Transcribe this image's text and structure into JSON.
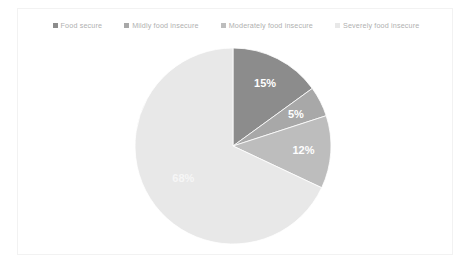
{
  "chart_data": {
    "type": "pie",
    "title": "",
    "categories": [
      "Food secure",
      "Mildly food insecure",
      "Moderately food insecure",
      "Severely food insecure"
    ],
    "values": [
      15,
      5,
      12,
      68
    ],
    "data_labels": [
      "15%",
      "5%",
      "12%",
      "68%"
    ],
    "unit": "%",
    "total": 100,
    "start_angle_deg": 0,
    "direction": "clockwise",
    "legend_position": "top",
    "grid": false,
    "colors": [
      "#8c8c8c",
      "#a8a8a8",
      "#bdbdbd",
      "#e8e8e8"
    ],
    "label_color": "#ffffff",
    "background": "#ffffff",
    "frame_color": "#f2f2f2"
  },
  "legend": {
    "items": [
      {
        "label": "Food secure",
        "color": "#8c8c8c"
      },
      {
        "label": "Mildly food insecure",
        "color": "#a8a8a8"
      },
      {
        "label": "Moderately food insecure",
        "color": "#bdbdbd"
      },
      {
        "label": "Severely food insecure",
        "color": "#e8e8e8"
      }
    ]
  }
}
